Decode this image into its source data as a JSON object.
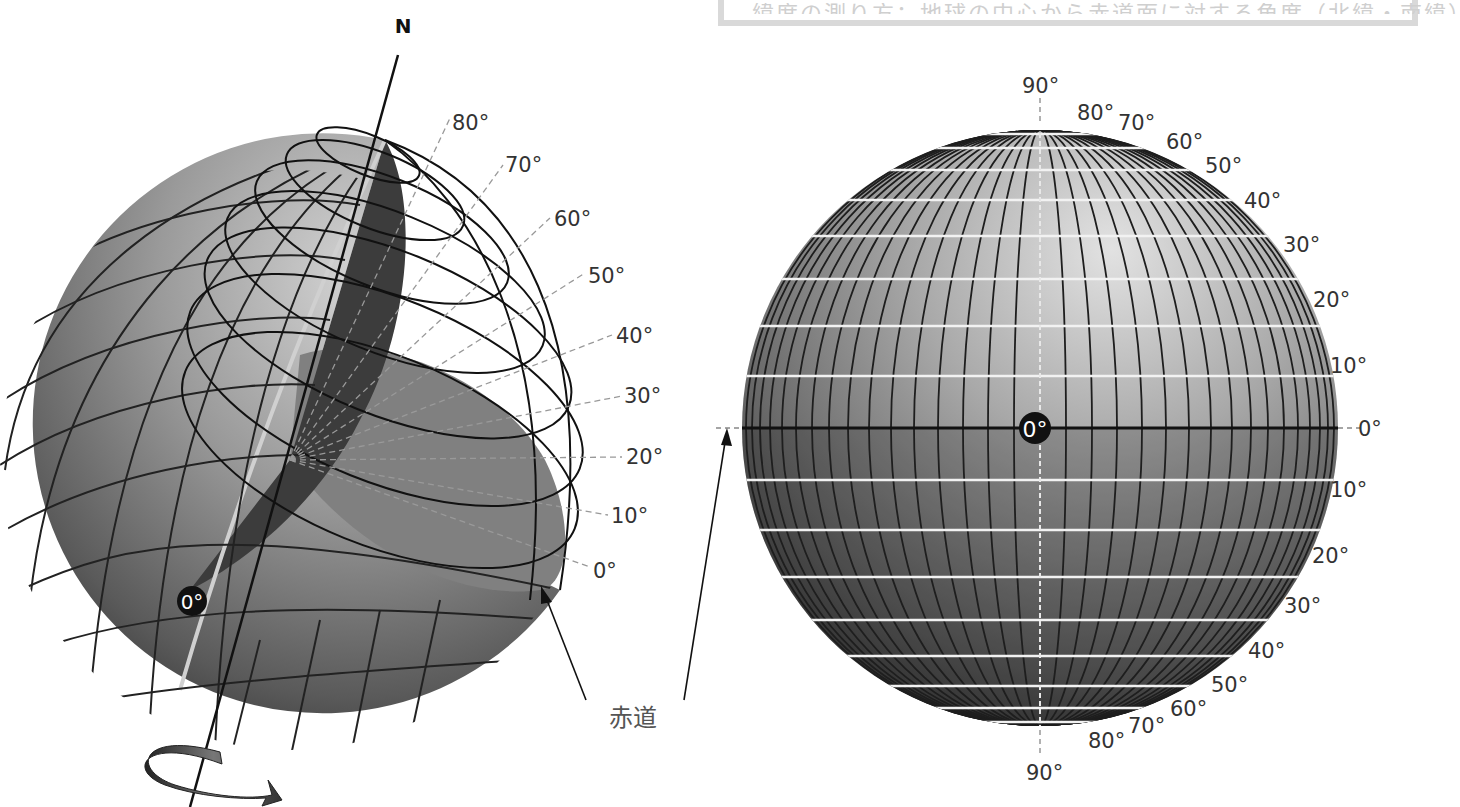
{
  "caption": {
    "text": "緯度の測り方：地球の中心から赤道面に対する角度（北緯・南緯）"
  },
  "left_globe": {
    "north_label": "N",
    "axis_origin_label": "0°",
    "latitude_labels": [
      "80°",
      "70°",
      "60°",
      "50°",
      "40°",
      "30°",
      "20°",
      "10°",
      "0°"
    ],
    "equator_label": "赤道",
    "rotation_arrow": "rotation-arrow"
  },
  "right_globe": {
    "center_label": "0°",
    "north_labels": [
      "90°",
      "80°",
      "70°",
      "60°",
      "50°",
      "40°",
      "30°",
      "20°",
      "10°"
    ],
    "equator_label": "0°",
    "south_labels": [
      "10°",
      "20°",
      "30°",
      "40°",
      "50°",
      "60°",
      "70°",
      "80°",
      "90°"
    ]
  },
  "colors": {
    "globe_light": "#c8c8c8",
    "globe_mid": "#8a8a8a",
    "globe_dark": "#2e2e2e",
    "grid_dark": "#1a1a1a",
    "grid_white": "#ffffff",
    "label": "#333333"
  }
}
